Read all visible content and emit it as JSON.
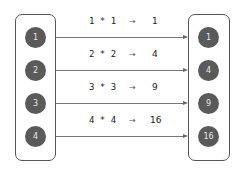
{
  "diagram": {
    "inputs": [
      "1",
      "2",
      "3",
      "4"
    ],
    "outputs": [
      "1",
      "4",
      "9",
      "16"
    ],
    "operations": [
      "1 * 1",
      "2 * 2",
      "3 * 3",
      "4 * 4"
    ],
    "arrow_symbol": "→",
    "colors": {
      "node_fill": "#5a5a5a",
      "node_text": "#e8e8e8",
      "border": "#555555",
      "line": "#777777"
    }
  }
}
